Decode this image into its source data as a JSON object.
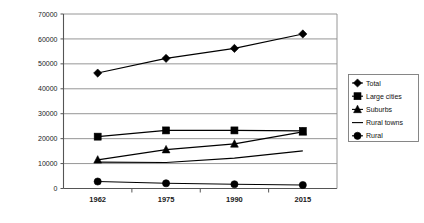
{
  "chart_data": {
    "type": "line",
    "title": "",
    "xlabel": "",
    "ylabel": "",
    "categories": [
      "1962",
      "1975",
      "1990",
      "2015"
    ],
    "ylim": [
      0,
      70000
    ],
    "ytick_labels": [
      "70000",
      "60000",
      "50000",
      "40000",
      "30000",
      "20000",
      "10000",
      "0"
    ],
    "ytick_values": [
      70000,
      60000,
      50000,
      40000,
      30000,
      20000,
      10000,
      0
    ],
    "grid": true,
    "legend_position": "right",
    "series": [
      {
        "name": "Total",
        "marker": "diamond",
        "values": [
          46300,
          52200,
          56200,
          62000
        ]
      },
      {
        "name": "Large cities",
        "marker": "square",
        "values": [
          20800,
          23300,
          23300,
          23100
        ]
      },
      {
        "name": "Suburbs",
        "marker": "triangle",
        "values": [
          11500,
          15600,
          17900,
          22700
        ]
      },
      {
        "name": "Rural towns",
        "marker": "none",
        "values": [
          10600,
          10400,
          12200,
          15100
        ]
      },
      {
        "name": "Rural",
        "marker": "circle",
        "values": [
          2800,
          2100,
          1700,
          1400
        ]
      }
    ]
  },
  "colors": {
    "series_stroke": "#000000",
    "gridline": "#8a8a8a",
    "axis": "#555555",
    "background": "#ffffff"
  }
}
